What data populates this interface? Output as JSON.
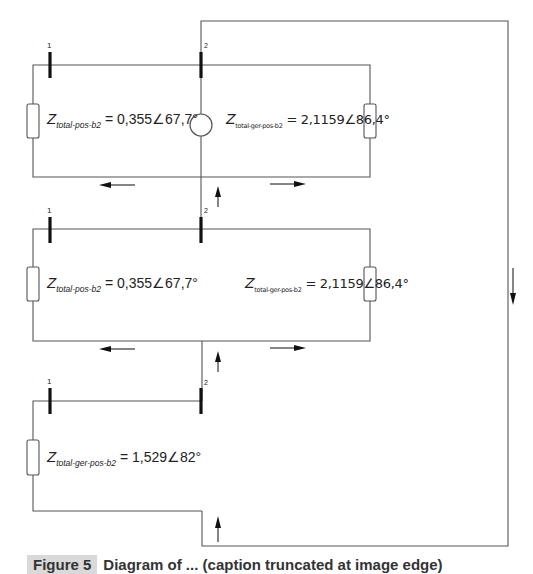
{
  "diagram": {
    "blocks": [
      {
        "id": "block-1",
        "bus_labels": [
          "1",
          "2"
        ],
        "left_impedance": {
          "symbol": "Z",
          "subscript": "total-pos-b2",
          "value": "= 0,355∠67,7°"
        },
        "right_impedance": {
          "symbol": "Z",
          "subscript": "total-ger-pos-b2",
          "value": "= 2,1159∠86,4°"
        },
        "has_generator": true
      },
      {
        "id": "block-2",
        "bus_labels": [
          "1",
          "2"
        ],
        "left_impedance": {
          "symbol": "Z",
          "subscript": "total-pos-b2",
          "value": "= 0,355∠67,7°"
        },
        "right_impedance": {
          "symbol": "Z",
          "subscript": "total-ger-pos-b2",
          "value": "= 2,1159∠86,4°"
        },
        "has_generator": false
      },
      {
        "id": "block-3",
        "bus_labels": [
          "1",
          "2"
        ],
        "left_impedance": {
          "symbol": "Z",
          "subscript": "total-ger-pos-b2",
          "value": "= 1,529∠82°"
        },
        "has_generator": false
      }
    ],
    "arrows": [
      {
        "direction": "left",
        "near": "block-1-bottom"
      },
      {
        "direction": "right",
        "near": "block-1-bottom"
      },
      {
        "direction": "up",
        "near": "block-1-bus2"
      },
      {
        "direction": "left",
        "near": "block-2-bottom"
      },
      {
        "direction": "right",
        "near": "block-2-bottom"
      },
      {
        "direction": "up",
        "near": "block-2-bus2"
      },
      {
        "direction": "up",
        "near": "block-3-return"
      },
      {
        "direction": "down",
        "near": "outer-return-path"
      }
    ],
    "colors": {
      "wire": "#555555",
      "bus": "#111111",
      "background": "#ffffff"
    }
  },
  "caption": {
    "tag": "Figure 5",
    "text": "Diagram of ... (caption truncated at image edge)"
  }
}
